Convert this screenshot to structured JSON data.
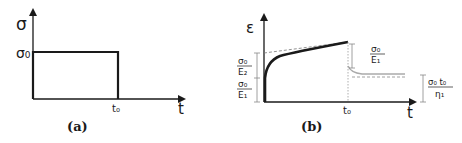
{
  "panel_a": {
    "caption": "(a)",
    "y_axis_label": "σ",
    "x_axis_label": "t",
    "level_label": "σ₀",
    "time_label": "t₀",
    "description": "Rectangular stress pulse of magnitude σ₀ applied from t=0 to t=t₀"
  },
  "panel_b": {
    "caption": "(b)",
    "y_axis_label": "ε",
    "x_axis_label": "t",
    "time_label": "t₀",
    "left_labels": [
      {
        "num": "σ₀",
        "den": "E₂"
      },
      {
        "num": "σ₀",
        "den": "E₁"
      }
    ],
    "recovery_label": {
      "num": "σ₀",
      "den": "E₁"
    },
    "permanent_label": {
      "num": "σ₀ t₀",
      "den": "η₁"
    },
    "description": "Strain response: instantaneous jump, delayed elastic creep, linear viscous flow, elastic recovery at t₀, delayed recovery to permanent strain"
  },
  "colors": {
    "stroke": "#1a1a1a",
    "dashed": "#777777",
    "recovery_curve": "#aaaaaa"
  }
}
